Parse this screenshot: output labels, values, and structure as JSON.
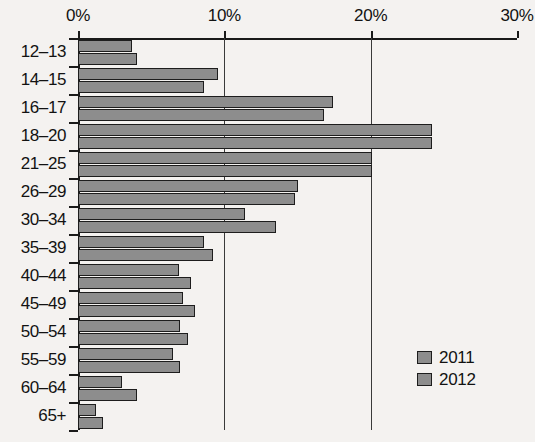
{
  "chart_data": {
    "type": "bar",
    "orientation": "horizontal",
    "title": "",
    "xlabel": "",
    "ylabel": "",
    "xlim": [
      0,
      30
    ],
    "xunit": "%",
    "xticks": [
      0,
      10,
      20,
      30
    ],
    "xtick_labels": [
      "0%",
      "10%",
      "20%",
      "30%"
    ],
    "grid": true,
    "grid_axis": "x",
    "legend_position": "bottom-right",
    "categories": [
      "12–13",
      "14–15",
      "16–17",
      "18–20",
      "21–25",
      "26–29",
      "30–34",
      "35–39",
      "40–44",
      "45–49",
      "50–54",
      "55–59",
      "60–64",
      "65+"
    ],
    "series": [
      {
        "name": "2011",
        "color": "#8d8d8d",
        "values": [
          3.7,
          9.6,
          17.4,
          24.2,
          20.1,
          15.0,
          11.4,
          8.6,
          6.9,
          7.2,
          7.0,
          6.5,
          3.0,
          1.2
        ]
      },
      {
        "name": "2012",
        "color": "#8d8d8d",
        "values": [
          4.0,
          8.6,
          16.8,
          24.2,
          20.1,
          14.8,
          13.5,
          9.2,
          7.7,
          8.0,
          7.5,
          7.0,
          4.0,
          1.7
        ]
      }
    ]
  },
  "legend": {
    "items": [
      {
        "label": "2011"
      },
      {
        "label": "2012"
      }
    ]
  },
  "colors": {
    "bar_fill": "#8d8d8d",
    "bar_stroke": "#1d1d1d",
    "axis": "#1a1a1a",
    "background": "#f4f2f0",
    "text": "#121212"
  }
}
